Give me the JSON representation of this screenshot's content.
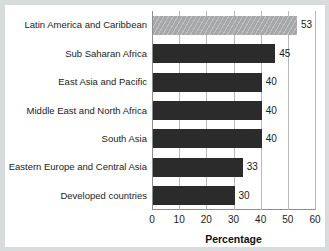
{
  "chart_data": {
    "type": "bar",
    "orientation": "horizontal",
    "title": "",
    "xlabel": "Percentage",
    "ylabel": "",
    "xlim": [
      0,
      60
    ],
    "xticks": [
      0,
      10,
      20,
      30,
      40,
      50,
      60
    ],
    "grid": "vertical",
    "legend": "none",
    "categories": [
      "Latin America and Caribbean",
      "Sub Saharan Africa",
      "East Asia and Pacific",
      "Middle East and North Africa",
      "South Asia",
      "Eastern Europe and Central Asia",
      "Developed countries"
    ],
    "values": [
      53,
      45,
      40,
      40,
      40,
      33,
      30
    ],
    "value_labels": [
      "53",
      "45",
      "40",
      "40",
      "40",
      "33",
      "30"
    ],
    "bar_styles": [
      "hatched",
      "dark",
      "dark",
      "dark",
      "dark",
      "dark",
      "dark"
    ],
    "colors": {
      "bar_dark": "#2b2b2b",
      "bar_highlight": "#a6a8aa",
      "axis": "#8c8f91",
      "gridline": "#b7babc",
      "text": "#1a1a1a",
      "background": "#ffffff",
      "frame": "#d9dcdd"
    }
  }
}
